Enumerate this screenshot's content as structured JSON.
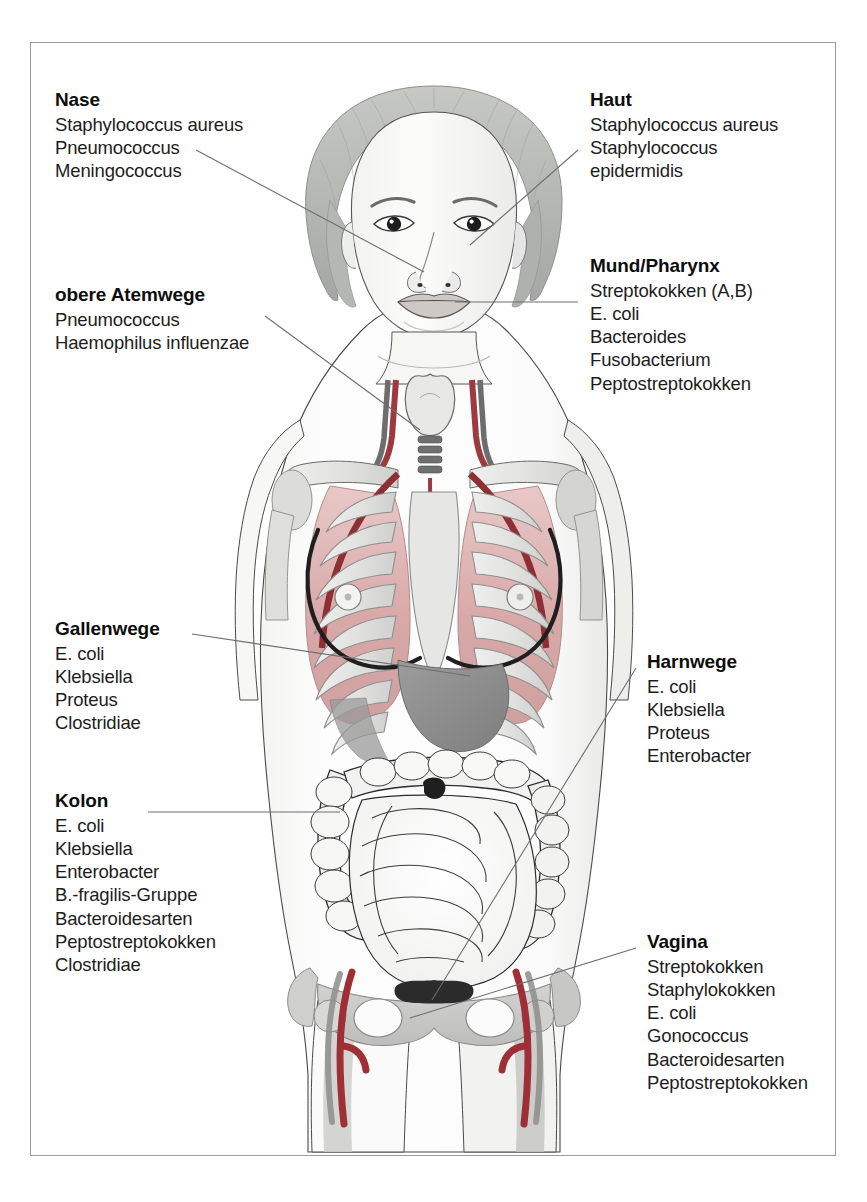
{
  "figure": {
    "kind": "anatomical-illustration",
    "colors": {
      "skin_outline": "#3a3a3a",
      "hair": "#b9bcb8",
      "bone": "#e4e4e2",
      "bone_shadow": "#c2c3c0",
      "lung": "#d8a9a9",
      "lung_light": "#e8c4c4",
      "artery": "#9d3a3f",
      "artery_dark": "#8e2f35",
      "vein_dark": "#6d6d6d",
      "organ_gray": "#8f8f8f",
      "liver": "#8d8d8d",
      "intestine_line": "#2b2b2b",
      "breast_line": "#262626",
      "frame": "#9a9a9a",
      "leader_line": "#6e6e6e"
    }
  },
  "labels": [
    {
      "id": "nase",
      "title": "Nase",
      "side": "left",
      "items": [
        "Staphylococcus aureus",
        "Pneumococcus",
        "Meningococcus"
      ]
    },
    {
      "id": "obere-atemwege",
      "title": "obere Atemwege",
      "side": "left",
      "items": [
        "Pneumococcus",
        "Haemophilus influenzae"
      ]
    },
    {
      "id": "gallenwege",
      "title": "Gallenwege",
      "side": "left",
      "items": [
        "E. coli",
        "Klebsiella",
        "Proteus",
        "Clostridiae"
      ]
    },
    {
      "id": "kolon",
      "title": "Kolon",
      "side": "left",
      "items": [
        "E. coli",
        "Klebsiella",
        "Enterobacter",
        "B.-fragilis-Gruppe",
        "Bacteroidesarten",
        "Peptostreptokokken",
        "Clostridiae"
      ]
    },
    {
      "id": "haut",
      "title": "Haut",
      "side": "right",
      "items": [
        "Staphylococcus aureus",
        "Staphylococcus epidermidis"
      ]
    },
    {
      "id": "mund-pharynx",
      "title": "Mund/Pharynx",
      "side": "right",
      "items": [
        "Streptokokken (A,B)",
        "E. coli",
        "Bacteroides",
        "Fusobacterium",
        "Peptostreptokokken"
      ]
    },
    {
      "id": "harnwege",
      "title": "Harnwege",
      "side": "right",
      "items": [
        "E. coli",
        "Klebsiella",
        "Proteus",
        "Enterobacter"
      ]
    },
    {
      "id": "vagina",
      "title": "Vagina",
      "side": "right",
      "items": [
        "Streptokokken",
        "Staphylokokken",
        "E. coli",
        "Gonococcus",
        "Bacteroidesarten",
        "Peptostreptokokken"
      ]
    }
  ],
  "leader_lines": [
    {
      "from": "nase",
      "target": "nose"
    },
    {
      "from": "obere-atemwege",
      "target": "larynx-trachea"
    },
    {
      "from": "gallenwege",
      "target": "liver-biliary-tract"
    },
    {
      "from": "kolon",
      "target": "ascending-colon"
    },
    {
      "from": "haut",
      "target": "cheek-skin"
    },
    {
      "from": "mund-pharynx",
      "target": "mouth"
    },
    {
      "from": "harnwege",
      "target": "bladder-urinary-tract"
    },
    {
      "from": "vagina",
      "target": "vagina"
    }
  ]
}
